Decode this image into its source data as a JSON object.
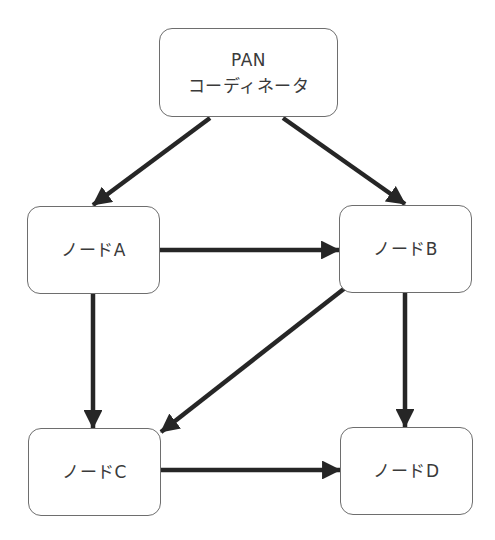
{
  "diagram": {
    "type": "network-topology",
    "arrow_color": "#262626",
    "border_color": "#6e6e6e",
    "nodes": {
      "coordinator": {
        "line1": "PAN",
        "line2": "コーディネータ",
        "x": 159,
        "y": 28,
        "w": 179,
        "h": 89
      },
      "a": {
        "label": "ノードA",
        "x": 27,
        "y": 206,
        "w": 133,
        "h": 88
      },
      "b": {
        "label": "ノードB",
        "x": 339,
        "y": 205,
        "w": 133,
        "h": 88
      },
      "c": {
        "label": "ノードC",
        "x": 28,
        "y": 428,
        "w": 133,
        "h": 88
      },
      "d": {
        "label": "ノードD",
        "x": 340,
        "y": 427,
        "w": 133,
        "h": 88
      }
    },
    "edges": [
      {
        "from": "PAN コーディネータ",
        "to": "ノードA",
        "x1": 210,
        "y1": 118,
        "x2": 93,
        "y2": 205
      },
      {
        "from": "PAN コーディネータ",
        "to": "ノードB",
        "x1": 283,
        "y1": 118,
        "x2": 405,
        "y2": 204
      },
      {
        "from": "ノードA",
        "to": "ノードB",
        "x1": 160,
        "y1": 250,
        "x2": 339,
        "y2": 250
      },
      {
        "from": "ノードA",
        "to": "ノードC",
        "x1": 93,
        "y1": 294,
        "x2": 93,
        "y2": 428
      },
      {
        "from": "ノードB",
        "to": "ノードC",
        "x1": 345,
        "y1": 288,
        "x2": 161,
        "y2": 432
      },
      {
        "from": "ノードB",
        "to": "ノードD",
        "x1": 405,
        "y1": 293,
        "x2": 405,
        "y2": 427
      },
      {
        "from": "ノードC",
        "to": "ノードD",
        "x1": 161,
        "y1": 470,
        "x2": 340,
        "y2": 470
      }
    ]
  }
}
